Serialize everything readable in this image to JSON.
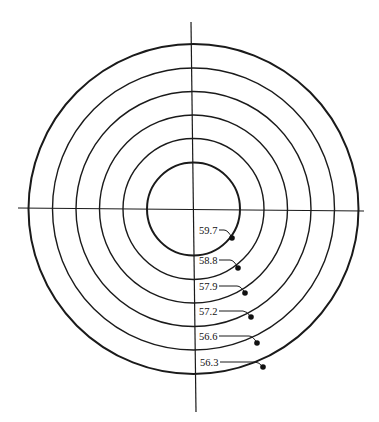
{
  "diagram": {
    "type": "concentric-contour-rings",
    "ink_color": "#1a1a1a",
    "background": "#ffffff",
    "rings": [
      {
        "label": "59.7",
        "order": 1
      },
      {
        "label": "58.8",
        "order": 2
      },
      {
        "label": "57.9",
        "order": 3
      },
      {
        "label": "57.2",
        "order": 4
      },
      {
        "label": "56.6",
        "order": 5
      },
      {
        "label": "56.3",
        "order": 6
      }
    ]
  }
}
